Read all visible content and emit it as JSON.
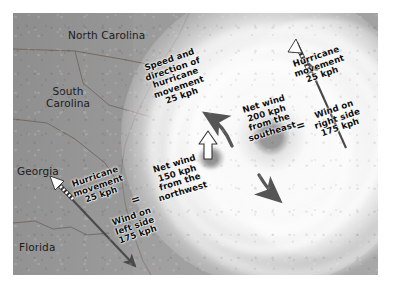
{
  "figure": {
    "type": "annotated-satellite-diagram"
  },
  "map": {
    "places": [
      {
        "name": "north-carolina",
        "label": "North Carolina"
      },
      {
        "name": "south-carolina",
        "label": "South\nCarolina"
      },
      {
        "name": "georgia",
        "label": "Georgia"
      },
      {
        "name": "florida",
        "label": "Florida"
      }
    ]
  },
  "annotations": {
    "center_motion": "Speed and\ndirection of\nhurricane\nmovement\n25 kph",
    "net_wind_se": "Net wind\n200 kph\nfrom the\nsoutheast",
    "right_movement": "Hurricane\nmovement\n25 kph",
    "right_wind": "Wind on\nright side\n175 kph",
    "left_movement": "Hurricane\nmovement\n25 kph",
    "left_wind": "Wind on\nleft side\n175 kph",
    "net_wind_nw": "Net wind\n150 kph\nfrom the\nnorthwest",
    "equals_right": "=",
    "equals_left": "="
  },
  "vectors": {
    "hurricane_movement_kph": 25,
    "wind_right_side_kph": 175,
    "wind_left_side_kph": 175,
    "net_wind_southeast_kph": 200,
    "net_wind_northwest_kph": 150
  },
  "colors": {
    "arrow_dark": "#4a4a4a",
    "arrow_outline": "#ffffff",
    "text": "#0d0d0d",
    "plate_background": "#9a9a9a",
    "page_background": "#ffffff"
  }
}
